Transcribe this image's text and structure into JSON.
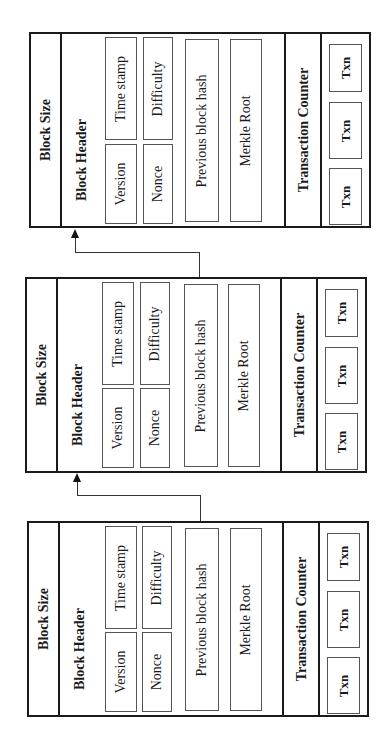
{
  "diagram": {
    "type": "blockchain-structure",
    "orientation": "rotated-90-ccw",
    "blocks": [
      {
        "block_size_label": "Block Size",
        "block_header_label": "Block Header",
        "fields": {
          "version": "Version",
          "time_stamp": "Time stamp",
          "nonce": "Nonce",
          "difficulty": "Difficulty",
          "previous_block_hash": "Previous block hash",
          "merkle_root": "Merkle Root"
        },
        "transaction_counter_label": "Transaction Counter",
        "transactions": [
          "Txn",
          "Txn",
          "Txn"
        ]
      },
      {
        "block_size_label": "Block Size",
        "block_header_label": "Block Header",
        "fields": {
          "version": "Version",
          "time_stamp": "Time stamp",
          "nonce": "Nonce",
          "difficulty": "Difficulty",
          "previous_block_hash": "Previous block hash",
          "merkle_root": "Merkle Root"
        },
        "transaction_counter_label": "Transaction Counter",
        "transactions": [
          "Txn",
          "Txn",
          "Txn"
        ]
      },
      {
        "block_size_label": "Block Size",
        "block_header_label": "Block Header",
        "fields": {
          "version": "Version",
          "time_stamp": "Time stamp",
          "nonce": "Nonce",
          "difficulty": "Difficulty",
          "previous_block_hash": "Previous block hash",
          "merkle_root": "Merkle Root"
        },
        "transaction_counter_label": "Transaction Counter",
        "transactions": [
          "Txn",
          "Txn",
          "Txn"
        ]
      }
    ],
    "links": [
      {
        "from": "block-2.previous_block_hash",
        "to": "block-1.block_header"
      },
      {
        "from": "block-3.previous_block_hash",
        "to": "block-2.block_header"
      }
    ],
    "colors": {
      "stroke": "#1a1a1a",
      "inner_stroke": "#555555",
      "background": "#ffffff"
    }
  }
}
